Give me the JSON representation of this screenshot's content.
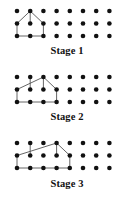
{
  "figure": {
    "title": "",
    "grid": {
      "columns": 8,
      "rows": 3,
      "x0": 17,
      "y0": 11,
      "dx": 13.2,
      "dy": 12.5,
      "dot_radius": 2.3,
      "dot_color": "#111111"
    },
    "line_color": "#555555",
    "line_width": 0.9
  },
  "stages": [
    {
      "label": "Stage 1",
      "id": "stage-1",
      "shape_points": "0,1 0,2 2,2 2,1 1,0",
      "extra_segments": [
        {
          "from": "1,0",
          "to": "1,1"
        }
      ],
      "width_cols": 2
    },
    {
      "label": "Stage 2",
      "id": "stage-2",
      "shape_points": "0,1 0,2 3,2 3,1 2,0",
      "extra_segments": [
        {
          "from": "1,0",
          "to": "1,1"
        },
        {
          "from": "2,0",
          "to": "2,1"
        }
      ],
      "width_cols": 3
    },
    {
      "label": "Stage 3",
      "id": "stage-3",
      "shape_points": "0,1 0,2 4,2 4,1 3,0",
      "extra_segments": [
        {
          "from": "1,0",
          "to": "1,1"
        },
        {
          "from": "3,0",
          "to": "3,1"
        }
      ],
      "width_cols": 4
    }
  ],
  "chart_data": {
    "type": "diagram",
    "categories": [
      "Stage 1",
      "Stage 2",
      "Stage 3"
    ],
    "values": [
      1,
      2,
      3
    ],
    "xlabel": "",
    "ylabel": ""
  }
}
